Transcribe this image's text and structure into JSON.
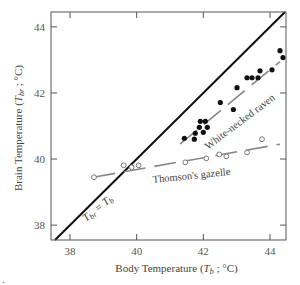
{
  "chart_data": {
    "type": "scatter",
    "title": "",
    "xlabel": "Body Temperature (T_b ; °C)",
    "ylabel": "Brain Temperature (T_br ; °C)",
    "xlabel_parts": {
      "prefix": "Body Temperature (",
      "sym": "T",
      "sub": "b",
      "suffix": " ; °C)"
    },
    "ylabel_parts": {
      "prefix": "Brain Temperature (",
      "sym": "T",
      "sub": "br",
      "suffix": " ; °C)"
    },
    "xlim": [
      37.43,
      44.48
    ],
    "ylim": [
      37.55,
      44.45
    ],
    "xticks": [
      38,
      40,
      42,
      44
    ],
    "yticks": [
      38,
      40,
      42,
      44
    ],
    "x_tick_labels": [
      "38",
      "40",
      "42",
      "44"
    ],
    "y_tick_labels": [
      "38",
      "40",
      "42",
      "44"
    ],
    "grid": false,
    "identity_line": {
      "label": "T_br = T_b",
      "label_parts": {
        "a": "T",
        "a_sub": "br",
        "eq": " = ",
        "b": "T",
        "b_sub": "b"
      }
    },
    "series": [
      {
        "name": "White-necked raven",
        "marker": "filled-circle",
        "color": "#111111",
        "points": [
          [
            41.43,
            40.63
          ],
          [
            41.73,
            40.6
          ],
          [
            41.76,
            40.78
          ],
          [
            41.88,
            40.96
          ],
          [
            41.91,
            41.14
          ],
          [
            42.06,
            41.14
          ],
          [
            42.0,
            40.81
          ],
          [
            42.12,
            40.96
          ],
          [
            42.51,
            41.71
          ],
          [
            42.9,
            41.5
          ],
          [
            43.01,
            42.16
          ],
          [
            43.31,
            42.46
          ],
          [
            43.46,
            42.46
          ],
          [
            43.64,
            42.46
          ],
          [
            43.7,
            42.67
          ],
          [
            44.06,
            42.7
          ],
          [
            44.3,
            43.28
          ],
          [
            44.39,
            43.07
          ]
        ],
        "trend": {
          "x": [
            41.3,
            44.3
          ],
          "y": [
            40.45,
            42.95
          ],
          "style": "dashed-gray"
        }
      },
      {
        "name": "Thomson's gazelle",
        "marker": "open-circle",
        "color": "#777777",
        "points": [
          [
            38.72,
            39.45
          ],
          [
            39.61,
            39.81
          ],
          [
            39.85,
            39.75
          ],
          [
            40.06,
            39.81
          ],
          [
            41.46,
            39.9
          ],
          [
            42.09,
            40.02
          ],
          [
            42.48,
            40.14
          ],
          [
            42.69,
            40.08
          ],
          [
            43.31,
            40.2
          ],
          [
            43.76,
            40.6
          ]
        ],
        "trend": {
          "x": [
            38.7,
            44.3
          ],
          "y": [
            39.45,
            40.45
          ],
          "style": "dashed-gray"
        }
      }
    ],
    "annotations": [
      {
        "text": "White-necked raven",
        "near": "raven-trend"
      },
      {
        "text": "Thomson's gazelle",
        "near": "gazelle-trend"
      }
    ]
  },
  "footnote_mark": "."
}
